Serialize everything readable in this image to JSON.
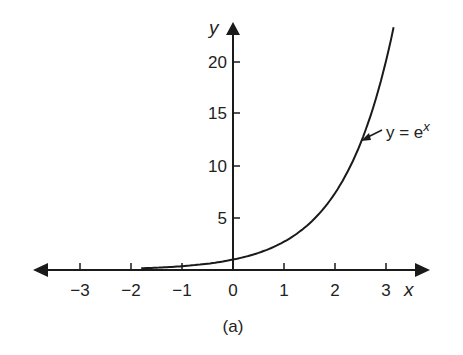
{
  "chart_data": {
    "type": "line",
    "title": "",
    "caption": "(a)",
    "xlabel": "x",
    "ylabel": "y",
    "xlim": [
      -3.5,
      3.4
    ],
    "ylim": [
      0,
      23
    ],
    "grid": false,
    "x_ticks": [
      -3,
      -2,
      -1,
      0,
      1,
      2,
      3
    ],
    "x_tick_labels": [
      "−3",
      "−2",
      "−1",
      "0",
      "1",
      "2",
      "3"
    ],
    "y_ticks": [
      5,
      10,
      15,
      20
    ],
    "y_tick_labels": [
      "5",
      "10",
      "15",
      "20"
    ],
    "series": [
      {
        "name": "y = e^x",
        "function": "exp(x)",
        "x": [
          -3,
          -2,
          -1,
          0,
          1,
          2,
          2.5,
          3,
          3.15
        ],
        "values": [
          0.05,
          0.14,
          0.37,
          1,
          2.72,
          7.39,
          12.18,
          20.09,
          23.3
        ]
      }
    ],
    "annotations": [
      {
        "text_prefix": "y = e",
        "text_sup": "x",
        "points_to_x": 2.6
      }
    ],
    "legend": "none"
  }
}
